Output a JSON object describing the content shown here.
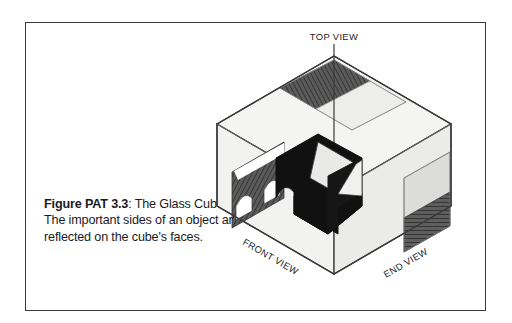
{
  "figure": {
    "caption_lead": "Figure PAT 3.3",
    "caption_rest": ": The Glass Cube. The important sides of an object are reflected on the cube's faces.",
    "caption_full": "Figure PAT 3.3: The Glass Cube. The important sides of an object are reflected on the cube's faces."
  },
  "labels": {
    "top_view": "TOP VIEW",
    "front_view": "FRONT VIEW",
    "end_view": "END VIEW"
  },
  "colors": {
    "page_background": "#ffffff",
    "frame_border": "#3a3a3c",
    "caption_text": "#1b1b1d",
    "cube_edge": "#3a3a3c",
    "face_glass_light": "#f2f2f0",
    "face_glass_mid": "#eaeae8",
    "projection_dark": "#575757",
    "projection_light": "#e4e4e2",
    "object_black": "#111111",
    "object_top_light": "#e8e8e6",
    "hatch_line": "#3d3d3d"
  },
  "diagram": {
    "type": "isometric-line-drawing",
    "faces": [
      {
        "name": "top-face",
        "projection": "top-view",
        "fill": "glass-light"
      },
      {
        "name": "front-left-face",
        "projection": "front-view",
        "fill": "glass-light"
      },
      {
        "name": "right-face",
        "projection": "end-view",
        "fill": "glass-mid"
      }
    ],
    "projections": [
      {
        "name": "top-view-projection",
        "shading": "dark-hatched-left-light-right"
      },
      {
        "name": "front-view-projection",
        "shading": "dark-hatched-with-two-arch-cutouts"
      },
      {
        "name": "end-view-projection",
        "shading": "light-upper-dark-hatched-lower"
      }
    ],
    "object": {
      "name": "center-block",
      "shading": "black-solid-with-light-top",
      "feature": "arched-notch"
    }
  }
}
